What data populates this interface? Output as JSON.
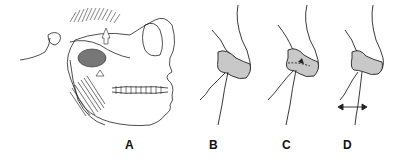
{
  "figure": {
    "panels": [
      {
        "id": "A",
        "label": "A",
        "description": "Lateral skull with masticatory muscles and arrows"
      },
      {
        "id": "B",
        "label": "B",
        "description": "TMJ condyle with articular disc"
      },
      {
        "id": "C",
        "label": "C",
        "description": "TMJ condyle with dashed disc line and arrow"
      },
      {
        "id": "D",
        "label": "D",
        "description": "TMJ condyle with bidirectional horizontal arrow"
      }
    ],
    "colors": {
      "line": "#222222",
      "disc_fill": "#c8c8c8",
      "muscle": "#333333",
      "background": "#ffffff"
    }
  }
}
